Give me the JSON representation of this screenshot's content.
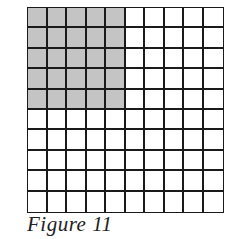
{
  "figure": {
    "caption": "Figure 11",
    "grid": {
      "rows": 10,
      "columns": 10,
      "shaded_rows": 5,
      "shaded_columns": 5,
      "shaded_cells": 25,
      "total_cells": 100
    },
    "colors": {
      "shade": "#c4c4c4",
      "line": "#1a1a1a",
      "background": "#ffffff"
    }
  }
}
